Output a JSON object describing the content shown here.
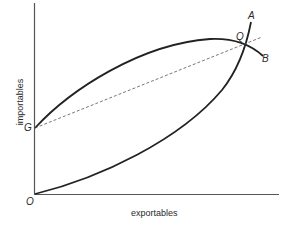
{
  "diagram": {
    "axes": {
      "x_label": "exportables",
      "y_label": "importables",
      "origin_label": "O"
    },
    "points": {
      "G": "G",
      "Q": "Q",
      "A": "A",
      "B": "B"
    },
    "curves": [
      {
        "name": "OA",
        "description": "convex curve from origin O rising steeply to A, passing through Q"
      },
      {
        "name": "GB",
        "description": "concave curve from G on the vertical axis, peaking then passing through Q to B"
      },
      {
        "name": "GQ-dashed",
        "description": "dashed straight line from G through Q"
      }
    ],
    "colors": {
      "line": "#222222",
      "dashed": "#555555",
      "axis": "#555555"
    }
  }
}
